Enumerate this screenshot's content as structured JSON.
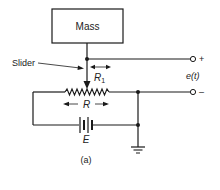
{
  "diagram": {
    "mass_label": "Mass",
    "slider_label": "Slider",
    "r1_label": "R",
    "r1_subscript": "1",
    "r_label": "R",
    "e_label": "E",
    "output_label": "e(t)",
    "plus_label": "+",
    "minus_label": "–",
    "caption": "(a)"
  },
  "colors": {
    "line": "#1a1a1a",
    "background": "#ffffff"
  }
}
